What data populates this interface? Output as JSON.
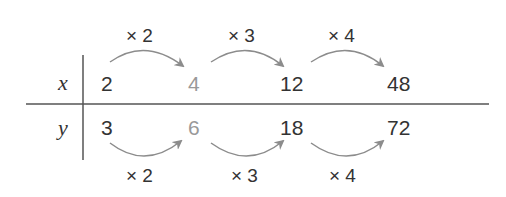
{
  "table": {
    "row_labels": {
      "x": "x",
      "y": "y"
    },
    "x_values": [
      "2",
      "4",
      "12",
      "48"
    ],
    "y_values": [
      "3",
      "6",
      "18",
      "72"
    ],
    "top_multipliers": [
      "× 2",
      "× 3",
      "× 4"
    ],
    "bottom_multipliers": [
      "× 2",
      "× 3",
      "× 4"
    ]
  },
  "colors": {
    "text": "#333333",
    "highlight": "#999999",
    "arrow": "#8c8c8c",
    "line": "#555555"
  }
}
